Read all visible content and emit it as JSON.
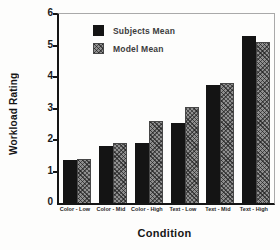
{
  "figure": {
    "ylabel": "Workload Rating",
    "xlabel": "Condition"
  },
  "legend": [
    {
      "label": "Subjects Mean",
      "swatch": "solid-black-square"
    },
    {
      "label": "Model Mean",
      "swatch": "hatched-gray-square"
    }
  ],
  "colors": {
    "subjects_bar": "#141414",
    "model_bar_base": "#8f8f8f",
    "model_bar_hatch": "#2e2e2e",
    "axis": "#151515",
    "frame": "#a9a9a9",
    "background": "#fdfdfc"
  },
  "chart_data": {
    "type": "bar",
    "categories": [
      "Color - Low",
      "Color - Mid",
      "Color - High",
      "Text - Low",
      "Text - Mid",
      "Text - High"
    ],
    "series": [
      {
        "name": "Subjects Mean",
        "values": [
          1.35,
          1.8,
          1.9,
          2.55,
          3.75,
          5.3
        ]
      },
      {
        "name": "Model Mean",
        "values": [
          1.4,
          1.9,
          2.6,
          3.05,
          3.8,
          5.1
        ]
      }
    ],
    "title": "",
    "xlabel": "Condition",
    "ylabel": "Workload Rating",
    "ylim": [
      0,
      6
    ],
    "yticks": [
      0,
      1,
      2,
      3,
      4,
      5,
      6
    ],
    "grid": false,
    "legend_position": "upper-left-inside"
  }
}
